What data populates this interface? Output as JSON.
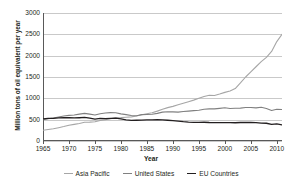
{
  "chart_data": {
    "type": "line",
    "title": "",
    "xlabel": "Year",
    "ylabel": "Million tons of oil equivalent per year",
    "xlim": [
      1965,
      2011
    ],
    "ylim": [
      0,
      3000
    ],
    "yticks": [
      0,
      500,
      1000,
      1500,
      2000,
      2500,
      3000
    ],
    "xticks": [
      1965,
      1970,
      1975,
      1980,
      1985,
      1990,
      1995,
      2000,
      2005,
      2010
    ],
    "grid": true,
    "legend_position": "bottom",
    "x": [
      1965,
      1966,
      1967,
      1968,
      1969,
      1970,
      1971,
      1972,
      1973,
      1974,
      1975,
      1976,
      1977,
      1978,
      1979,
      1980,
      1981,
      1982,
      1983,
      1984,
      1985,
      1986,
      1987,
      1988,
      1989,
      1990,
      1991,
      1992,
      1993,
      1994,
      1995,
      1996,
      1997,
      1998,
      1999,
      2000,
      2001,
      2002,
      2003,
      2004,
      2005,
      2006,
      2007,
      2008,
      2009,
      2010,
      2011
    ],
    "series": [
      {
        "name": "Asia Pacific",
        "color": "#a6a6a6",
        "values": [
          250,
          268,
          288,
          312,
          338,
          368,
          390,
          412,
          440,
          442,
          452,
          480,
          500,
          520,
          545,
          548,
          556,
          566,
          584,
          614,
          640,
          664,
          700,
          744,
          782,
          812,
          848,
          884,
          920,
          958,
          1000,
          1044,
          1072,
          1068,
          1100,
          1140,
          1172,
          1230,
          1360,
          1500,
          1620,
          1740,
          1860,
          1960,
          2100,
          2330,
          2500
        ]
      },
      {
        "name": "United States",
        "color": "#808080",
        "values": [
          500,
          520,
          538,
          562,
          586,
          600,
          608,
          630,
          648,
          630,
          610,
          640,
          655,
          665,
          662,
          635,
          618,
          596,
          592,
          618,
          622,
          628,
          648,
          676,
          686,
          682,
          676,
          690,
          700,
          712,
          722,
          744,
          752,
          752,
          764,
          778,
          760,
          768,
          770,
          784,
          786,
          776,
          792,
          760,
          716,
          744,
          740
        ]
      },
      {
        "name": "EU Countries",
        "color": "#231f20",
        "values": [
          520,
          528,
          530,
          540,
          545,
          548,
          540,
          545,
          552,
          534,
          512,
          528,
          524,
          530,
          534,
          516,
          496,
          484,
          486,
          488,
          494,
          496,
          498,
          494,
          486,
          478,
          468,
          452,
          442,
          436,
          436,
          440,
          434,
          432,
          430,
          430,
          432,
          428,
          434,
          436,
          434,
          430,
          420,
          416,
          388,
          400,
          380
        ]
      }
    ]
  },
  "axes": {
    "ytick_labels": [
      "0",
      "500",
      "1000",
      "1500",
      "2000",
      "2500",
      "3000"
    ],
    "xtick_labels": [
      "1965",
      "1970",
      "1975",
      "1980",
      "1985",
      "1990",
      "1995",
      "2000",
      "2005",
      "2010"
    ],
    "x_title": "Year",
    "y_title": "Million tons of oil equivalent per year"
  },
  "legend": {
    "items": [
      {
        "label": "Asia Pacific",
        "color": "#a6a6a6"
      },
      {
        "label": "United States",
        "color": "#808080"
      },
      {
        "label": "EU Countries",
        "color": "#231f20"
      }
    ]
  }
}
